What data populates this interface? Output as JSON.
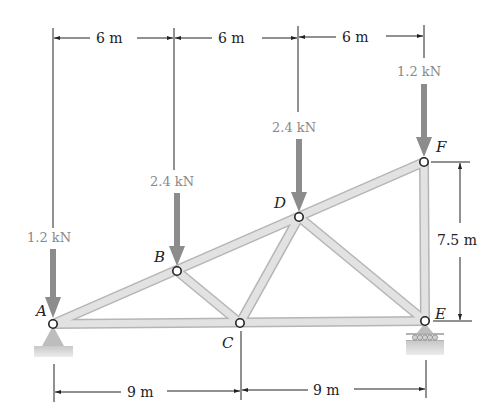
{
  "nodes": [
    {
      "id": "A",
      "label": "A",
      "x": 53,
      "y": 324,
      "lx": 36,
      "ly": 316
    },
    {
      "id": "B",
      "label": "B",
      "x": 177,
      "y": 271,
      "lx": 153,
      "ly": 263
    },
    {
      "id": "C",
      "label": "C",
      "x": 240,
      "y": 323,
      "lx": 222,
      "ly": 346
    },
    {
      "id": "D",
      "label": "D",
      "x": 299,
      "y": 217,
      "lx": 275,
      "ly": 209
    },
    {
      "id": "E",
      "label": "E",
      "x": 425,
      "y": 321,
      "lx": 435,
      "ly": 318
    },
    {
      "id": "F",
      "label": "F",
      "x": 424,
      "y": 162,
      "lx": 435,
      "ly": 152
    }
  ],
  "members": [
    [
      "A",
      "B"
    ],
    [
      "B",
      "D"
    ],
    [
      "D",
      "F"
    ],
    [
      "A",
      "C"
    ],
    [
      "C",
      "E"
    ],
    [
      "B",
      "C"
    ],
    [
      "C",
      "D"
    ],
    [
      "D",
      "E"
    ],
    [
      "E",
      "F"
    ]
  ],
  "loads": [
    {
      "node": "A",
      "label": "1.2 kN",
      "x": 53,
      "top": 250,
      "tip": 316,
      "tx": 28,
      "ty": 243
    },
    {
      "node": "B",
      "label": "2.4 kN",
      "x": 177,
      "top": 193,
      "tip": 263,
      "tx": 150,
      "ty": 186
    },
    {
      "node": "D",
      "label": "2.4 kN",
      "x": 299,
      "top": 140,
      "tip": 209,
      "tx": 272,
      "ty": 133
    },
    {
      "node": "F",
      "label": "1.2 kN",
      "x": 424,
      "top": 84,
      "tip": 154,
      "tx": 397,
      "ty": 77
    }
  ],
  "dimensions": {
    "top": [
      {
        "label": "6 m",
        "x1": 53,
        "x2": 174,
        "y": 38
      },
      {
        "label": "6 m",
        "x1": 174,
        "x2": 298,
        "y": 38
      },
      {
        "label": "6 m",
        "x1": 298,
        "x2": 424,
        "y": 38
      }
    ],
    "bottom": [
      {
        "label": "9 m",
        "x1": 53,
        "x2": 240,
        "y": 392
      },
      {
        "label": "9 m",
        "x1": 240,
        "x2": 425,
        "y": 392
      }
    ],
    "right": {
      "label": "7.5 m",
      "x": 460,
      "y1": 162,
      "y2": 321
    }
  },
  "labels": {
    "top_dim_1": "6 m",
    "top_dim_2": "6 m",
    "top_dim_3": "6 m",
    "bot_dim_1": "9 m",
    "bot_dim_2": "9 m",
    "right_dim": "7.5 m",
    "load_A": "1.2 kN",
    "load_B": "2.4 kN",
    "load_D": "2.4 kN",
    "load_F": "1.2 kN",
    "node_A": "A",
    "node_B": "B",
    "node_C": "C",
    "node_D": "D",
    "node_E": "E",
    "node_F": "F"
  },
  "colors": {
    "member_fill": "#dcdcdc",
    "member_edge": "#b8b8b8",
    "load_arrow": "#8c8c8c",
    "load_text": "#888888",
    "dim_line": "#222222",
    "support": "#c4c4c4"
  }
}
